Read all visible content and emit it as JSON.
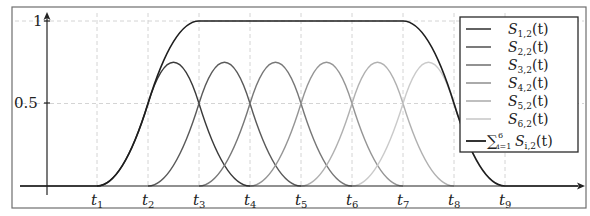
{
  "chart_data": {
    "type": "line",
    "title": "",
    "xlabel": "",
    "ylabel": "",
    "x_tick_labels": [
      "t1",
      "t2",
      "t3",
      "t4",
      "t5",
      "t6",
      "t7",
      "t8",
      "t9"
    ],
    "x_ticks_display": [
      {
        "base": "t",
        "sub": "1"
      },
      {
        "base": "t",
        "sub": "2"
      },
      {
        "base": "t",
        "sub": "3"
      },
      {
        "base": "t",
        "sub": "4"
      },
      {
        "base": "t",
        "sub": "5"
      },
      {
        "base": "t",
        "sub": "6"
      },
      {
        "base": "t",
        "sub": "7"
      },
      {
        "base": "t",
        "sub": "8"
      },
      {
        "base": "t",
        "sub": "9"
      }
    ],
    "y_ticks": [
      0.5,
      1
    ],
    "y_tick_labels": [
      "0.5",
      "1"
    ],
    "ylim": [
      0,
      1.05
    ],
    "grid": true,
    "grid_style": "dashed",
    "legend_position": "upper right",
    "series": [
      {
        "name": "S_{1,2}(t)",
        "support": [
          "t1",
          "t4"
        ],
        "peak": 0.75,
        "peak_at": "midpoint of t2,t3",
        "color": "#3a3a3a"
      },
      {
        "name": "S_{2,2}(t)",
        "support": [
          "t2",
          "t5"
        ],
        "peak": 0.75,
        "peak_at": "midpoint of t3,t4",
        "color": "#5a5a5a"
      },
      {
        "name": "S_{3,2}(t)",
        "support": [
          "t3",
          "t6"
        ],
        "peak": 0.75,
        "peak_at": "midpoint of t4,t5",
        "color": "#777777"
      },
      {
        "name": "S_{4,2}(t)",
        "support": [
          "t4",
          "t7"
        ],
        "peak": 0.75,
        "peak_at": "midpoint of t5,t6",
        "color": "#959595"
      },
      {
        "name": "S_{5,2}(t)",
        "support": [
          "t5",
          "t8"
        ],
        "peak": 0.75,
        "peak_at": "midpoint of t6,t7",
        "color": "#b0b0b0"
      },
      {
        "name": "S_{6,2}(t)",
        "support": [
          "t6",
          "t9"
        ],
        "peak": 0.75,
        "peak_at": "midpoint of t7,t8",
        "color": "#cacaca"
      },
      {
        "name": "sum_{i=1}^{6} S_{i,2}(t)",
        "values_by_knot": [
          0,
          0.5,
          1,
          1,
          1,
          1,
          1,
          0.5,
          0
        ],
        "color": "#1e1e1e"
      }
    ]
  },
  "legend": {
    "items": [
      {
        "base": "S",
        "sub": "1,2",
        "rest": "(t)",
        "color": "#3a3a3a"
      },
      {
        "base": "S",
        "sub": "2,2",
        "rest": "(t)",
        "color": "#5a5a5a"
      },
      {
        "base": "S",
        "sub": "3,2",
        "rest": "(t)",
        "color": "#777777"
      },
      {
        "base": "S",
        "sub": "4,2",
        "rest": "(t)",
        "color": "#959595"
      },
      {
        "base": "S",
        "sub": "5,2",
        "rest": "(t)",
        "color": "#b0b0b0"
      },
      {
        "base": "S",
        "sub": "6,2",
        "rest": "(t)",
        "color": "#cacaca"
      }
    ],
    "sum_item": {
      "sigma": "∑",
      "sup": "6",
      "sub": "i=1",
      "base": "S",
      "base_sub": "i,2",
      "rest": "(t)",
      "color": "#1e1e1e"
    }
  }
}
